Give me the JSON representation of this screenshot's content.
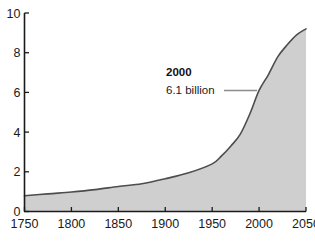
{
  "chart_data": {
    "type": "area",
    "title": "",
    "subtitle": "",
    "xlabel": "",
    "ylabel": "",
    "xlim": [
      1750,
      2050
    ],
    "ylim": [
      0,
      10
    ],
    "grid": false,
    "legend": "none",
    "x_ticks": [
      "1750",
      "1800",
      "1850",
      "1900",
      "1950",
      "2000",
      "2050"
    ],
    "x_tick_values": [
      1750,
      1800,
      1850,
      1900,
      1950,
      2000,
      2050
    ],
    "y_ticks": [
      "0",
      "2",
      "4",
      "6",
      "8",
      "10"
    ],
    "y_tick_values": [
      0,
      2,
      4,
      6,
      8,
      10
    ],
    "series": [
      {
        "name": "World population (billions)",
        "x": [
          1750,
          1775,
          1800,
          1825,
          1850,
          1875,
          1900,
          1925,
          1950,
          1960,
          1970,
          1980,
          1990,
          2000,
          2010,
          2020,
          2030,
          2040,
          2050
        ],
        "values": [
          0.79,
          0.89,
          0.98,
          1.1,
          1.26,
          1.4,
          1.65,
          1.95,
          2.4,
          2.8,
          3.3,
          3.9,
          4.9,
          6.1,
          6.9,
          7.8,
          8.4,
          8.9,
          9.2
        ]
      }
    ],
    "annotations": [
      {
        "label": "2000",
        "value_text": "6.1 billion",
        "x": 2000,
        "y": 6.1
      }
    ],
    "colors": {
      "area_fill": "#cfcfcf",
      "curve_line": "#4d4d4d",
      "axis": "#1a1a1a",
      "text": "#1a1a1a",
      "leader_line": "#8c8c8c",
      "background": "#ffffff"
    }
  }
}
